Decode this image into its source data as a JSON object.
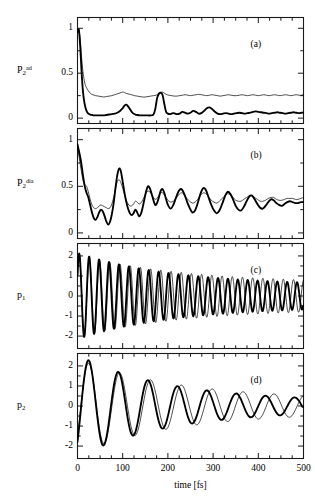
{
  "figure": {
    "xaxis": {
      "title": "time [fs]",
      "ticks": [
        "0",
        "100",
        "200",
        "300",
        "400",
        "500"
      ],
      "min": 0,
      "max": 500,
      "minor_tick_interval": 25
    },
    "panels": [
      {
        "tag": "(a)",
        "ylabel_base": "P",
        "ylabel_sub": "2",
        "ylabel_sup": "ad",
        "yticks": [
          "1",
          "0.5",
          "0"
        ],
        "ytick_values": [
          1,
          0.5,
          0
        ],
        "ymin": -0.06,
        "ymax": 1.12
      },
      {
        "tag": "(b)",
        "ylabel_base": "P",
        "ylabel_sub": "2",
        "ylabel_sup": "dia",
        "yticks": [
          "1",
          "0.5",
          "0"
        ],
        "ytick_values": [
          1,
          0.5,
          0
        ],
        "ymin": -0.06,
        "ymax": 1.12
      },
      {
        "tag": "(c)",
        "ylabel_base": "p",
        "ylabel_sub": "1",
        "ylabel_sup": "",
        "yticks": [
          "2",
          "1",
          "0",
          "-1",
          "-2"
        ],
        "ytick_values": [
          2,
          1,
          0,
          -1,
          -2
        ],
        "ymin": -2.62,
        "ymax": 2.62
      },
      {
        "tag": "(d)",
        "ylabel_base": "p",
        "ylabel_sub": "2",
        "ylabel_sup": "",
        "yticks": [
          "2",
          "1",
          "0",
          "-1",
          "-2"
        ],
        "ytick_values": [
          2,
          1,
          0,
          -1,
          -2
        ],
        "ymin": -2.62,
        "ymax": 2.62
      }
    ]
  },
  "chart_data": {
    "type": "line",
    "title": "",
    "xlabel": "time [fs]",
    "grid": false,
    "legend": "none",
    "series_styles": [
      {
        "name": "thick",
        "color": "#000000",
        "width": 1.8
      },
      {
        "name": "thin",
        "color": "#000000",
        "width": 0.7
      }
    ],
    "subplots": [
      {
        "tag": "(a)",
        "ylabel": "P_2^ad",
        "xlim": [
          0,
          500
        ],
        "ylim": [
          -0.06,
          1.12
        ],
        "yticks": [
          0,
          0.5,
          1
        ],
        "series": [
          {
            "name": "thick",
            "x": [
              0,
              3,
              6,
              9,
              12,
              15,
              18,
              21,
              24,
              28,
              32,
              36,
              40,
              46,
              52,
              58,
              64,
              70,
              76,
              82,
              88,
              94,
              100,
              104,
              108,
              112,
              116,
              120,
              124,
              128,
              132,
              138,
              144,
              150,
              156,
              162,
              168,
              172,
              176,
              180,
              184,
              188,
              192,
              196,
              200,
              204,
              208,
              212,
              216,
              220,
              226,
              232,
              238,
              244,
              250,
              256,
              262,
              268,
              274,
              280,
              286,
              292,
              298,
              304,
              310,
              316,
              322,
              328,
              334,
              340,
              346,
              352,
              358,
              364,
              370,
              376,
              382,
              388,
              394,
              400,
              406,
              412,
              418,
              424,
              430,
              436,
              442,
              448,
              454,
              460,
              466,
              472,
              478,
              484,
              490,
              496,
              500
            ],
            "y": [
              0.96,
              0.98,
              0.8,
              0.52,
              0.3,
              0.18,
              0.11,
              0.07,
              0.05,
              0.04,
              0.035,
              0.03,
              0.03,
              0.03,
              0.03,
              0.03,
              0.035,
              0.04,
              0.045,
              0.05,
              0.06,
              0.08,
              0.11,
              0.14,
              0.15,
              0.13,
              0.1,
              0.07,
              0.05,
              0.04,
              0.035,
              0.03,
              0.03,
              0.03,
              0.03,
              0.03,
              0.04,
              0.1,
              0.22,
              0.27,
              0.28,
              0.26,
              0.16,
              0.07,
              0.05,
              0.045,
              0.05,
              0.055,
              0.05,
              0.045,
              0.05,
              0.07,
              0.06,
              0.05,
              0.06,
              0.08,
              0.07,
              0.05,
              0.055,
              0.08,
              0.11,
              0.12,
              0.1,
              0.07,
              0.05,
              0.045,
              0.05,
              0.055,
              0.05,
              0.045,
              0.05,
              0.055,
              0.06,
              0.055,
              0.05,
              0.055,
              0.06,
              0.07,
              0.075,
              0.07,
              0.065,
              0.06,
              0.055,
              0.05,
              0.055,
              0.06,
              0.065,
              0.06,
              0.055,
              0.05,
              0.055,
              0.06,
              0.065,
              0.06,
              0.055,
              0.06,
              0.06
            ]
          },
          {
            "name": "thin",
            "x": [
              0,
              3,
              6,
              9,
              12,
              15,
              18,
              22,
              26,
              30,
              34,
              40,
              46,
              52,
              58,
              64,
              70,
              76,
              82,
              88,
              94,
              100,
              104,
              108,
              112,
              116,
              120,
              126,
              132,
              138,
              144,
              150,
              156,
              162,
              168,
              174,
              178,
              182,
              186,
              190,
              196,
              202,
              208,
              214,
              220,
              226,
              232,
              238,
              244,
              250,
              256,
              262,
              268,
              274,
              280,
              286,
              292,
              298,
              304,
              310,
              316,
              322,
              328,
              334,
              340,
              346,
              352,
              358,
              364,
              370,
              376,
              382,
              388,
              394,
              400,
              406,
              412,
              418,
              424,
              430,
              436,
              442,
              448,
              454,
              460,
              466,
              472,
              478,
              484,
              490,
              496,
              500
            ],
            "y": [
              0.97,
              0.99,
              0.88,
              0.68,
              0.52,
              0.42,
              0.36,
              0.32,
              0.29,
              0.27,
              0.26,
              0.25,
              0.245,
              0.24,
              0.235,
              0.24,
              0.245,
              0.25,
              0.26,
              0.27,
              0.28,
              0.29,
              0.285,
              0.275,
              0.27,
              0.265,
              0.26,
              0.25,
              0.245,
              0.24,
              0.235,
              0.235,
              0.24,
              0.245,
              0.25,
              0.255,
              0.27,
              0.285,
              0.29,
              0.285,
              0.265,
              0.255,
              0.25,
              0.245,
              0.245,
              0.25,
              0.255,
              0.26,
              0.255,
              0.25,
              0.255,
              0.26,
              0.265,
              0.26,
              0.255,
              0.25,
              0.255,
              0.26,
              0.255,
              0.25,
              0.245,
              0.25,
              0.255,
              0.26,
              0.255,
              0.25,
              0.25,
              0.255,
              0.26,
              0.255,
              0.25,
              0.255,
              0.26,
              0.255,
              0.25,
              0.255,
              0.26,
              0.255,
              0.25,
              0.255,
              0.26,
              0.255,
              0.25,
              0.255,
              0.26,
              0.255,
              0.25,
              0.255,
              0.26,
              0.255,
              0.255,
              0.26
            ]
          }
        ]
      },
      {
        "tag": "(b)",
        "ylabel": "P_2^dia",
        "xlim": [
          0,
          500
        ],
        "ylim": [
          -0.06,
          1.12
        ],
        "yticks": [
          0,
          0.5,
          1
        ],
        "series": [
          {
            "name": "thick",
            "x": [
              0,
              4,
              8,
              12,
              16,
              20,
              24,
              28,
              32,
              36,
              40,
              44,
              48,
              52,
              56,
              60,
              64,
              68,
              72,
              76,
              80,
              84,
              88,
              92,
              96,
              100,
              104,
              108,
              112,
              116,
              120,
              124,
              128,
              132,
              136,
              140,
              144,
              148,
              152,
              156,
              160,
              164,
              168,
              172,
              176,
              180,
              184,
              188,
              192,
              196,
              200,
              206,
              212,
              218,
              224,
              230,
              236,
              242,
              248,
              254,
              260,
              266,
              272,
              278,
              284,
              290,
              296,
              302,
              308,
              314,
              320,
              326,
              332,
              338,
              344,
              350,
              356,
              362,
              368,
              374,
              380,
              386,
              392,
              398,
              404,
              410,
              416,
              422,
              428,
              434,
              440,
              446,
              452,
              458,
              464,
              470,
              476,
              482,
              488,
              494,
              500
            ],
            "y": [
              0.95,
              0.86,
              0.76,
              0.62,
              0.5,
              0.43,
              0.38,
              0.3,
              0.22,
              0.16,
              0.14,
              0.17,
              0.22,
              0.25,
              0.23,
              0.18,
              0.12,
              0.09,
              0.12,
              0.2,
              0.32,
              0.48,
              0.62,
              0.69,
              0.66,
              0.55,
              0.43,
              0.33,
              0.26,
              0.21,
              0.19,
              0.21,
              0.25,
              0.22,
              0.18,
              0.2,
              0.27,
              0.36,
              0.45,
              0.5,
              0.48,
              0.42,
              0.35,
              0.3,
              0.32,
              0.38,
              0.45,
              0.47,
              0.43,
              0.36,
              0.3,
              0.26,
              0.3,
              0.38,
              0.45,
              0.47,
              0.42,
              0.34,
              0.27,
              0.22,
              0.24,
              0.32,
              0.42,
              0.48,
              0.46,
              0.38,
              0.3,
              0.24,
              0.21,
              0.24,
              0.31,
              0.39,
              0.44,
              0.42,
              0.36,
              0.29,
              0.25,
              0.24,
              0.28,
              0.34,
              0.39,
              0.4,
              0.36,
              0.31,
              0.27,
              0.26,
              0.29,
              0.33,
              0.36,
              0.35,
              0.32,
              0.3,
              0.29,
              0.31,
              0.33,
              0.34,
              0.33,
              0.32,
              0.32,
              0.33,
              0.33
            ]
          },
          {
            "name": "thin",
            "x": [
              0,
              4,
              8,
              12,
              16,
              20,
              24,
              28,
              32,
              36,
              40,
              44,
              48,
              52,
              56,
              60,
              64,
              68,
              72,
              76,
              80,
              84,
              88,
              92,
              96,
              100,
              104,
              108,
              112,
              116,
              120,
              124,
              128,
              132,
              136,
              140,
              144,
              148,
              152,
              156,
              160,
              164,
              168,
              172,
              176,
              180,
              184,
              188,
              192,
              196,
              200,
              206,
              212,
              218,
              224,
              230,
              236,
              242,
              248,
              254,
              260,
              266,
              272,
              278,
              284,
              290,
              296,
              302,
              308,
              314,
              320,
              326,
              332,
              338,
              344,
              350,
              356,
              362,
              368,
              374,
              380,
              386,
              392,
              398,
              404,
              410,
              416,
              422,
              428,
              434,
              440,
              446,
              452,
              458,
              464,
              470,
              476,
              482,
              488,
              494,
              500
            ],
            "y": [
              0.92,
              0.8,
              0.68,
              0.57,
              0.52,
              0.5,
              0.44,
              0.36,
              0.3,
              0.27,
              0.26,
              0.27,
              0.29,
              0.3,
              0.29,
              0.28,
              0.27,
              0.26,
              0.27,
              0.31,
              0.38,
              0.47,
              0.55,
              0.57,
              0.54,
              0.48,
              0.41,
              0.35,
              0.31,
              0.29,
              0.29,
              0.31,
              0.34,
              0.33,
              0.31,
              0.32,
              0.35,
              0.39,
              0.43,
              0.45,
              0.44,
              0.41,
              0.38,
              0.36,
              0.37,
              0.4,
              0.43,
              0.43,
              0.41,
              0.38,
              0.35,
              0.33,
              0.34,
              0.37,
              0.41,
              0.43,
              0.41,
              0.37,
              0.34,
              0.32,
              0.33,
              0.36,
              0.4,
              0.43,
              0.42,
              0.39,
              0.35,
              0.33,
              0.32,
              0.34,
              0.37,
              0.4,
              0.42,
              0.41,
              0.38,
              0.35,
              0.34,
              0.34,
              0.36,
              0.38,
              0.4,
              0.4,
              0.38,
              0.36,
              0.34,
              0.34,
              0.35,
              0.37,
              0.38,
              0.38,
              0.36,
              0.35,
              0.35,
              0.36,
              0.37,
              0.37,
              0.37,
              0.36,
              0.36,
              0.37,
              0.38
            ]
          }
        ]
      },
      {
        "tag": "(c)",
        "ylabel": "p_1",
        "xlim": [
          0,
          500
        ],
        "ylim": [
          -2.62,
          2.62
        ],
        "yticks": [
          -2,
          -1,
          0,
          1,
          2
        ],
        "oscillation_period_fs": 22,
        "envelope_start": 2.1,
        "envelope_end": 0.55,
        "series": [
          {
            "name": "thick",
            "description": "p1 thick curve: decaying oscillation, period ~22 fs, amplitude 2.1 decaying to ~0.55"
          },
          {
            "name": "thin",
            "description": "p1 thin curve: same period, slight phase lag growing with time, amplitude 2.0 decaying to ~0.6"
          }
        ]
      },
      {
        "tag": "(d)",
        "ylabel": "p_2",
        "xlim": [
          0,
          500
        ],
        "ylim": [
          -2.62,
          2.62
        ],
        "yticks": [
          -2,
          -1,
          0,
          1,
          2
        ],
        "oscillation_period_fs": 66,
        "envelope_start": 2.5,
        "envelope_end": 0.25,
        "series": [
          {
            "name": "thick",
            "description": "p2 thick curve: decaying oscillation, period ~66 fs, amplitude 2.5 decaying to ~0.25"
          },
          {
            "name": "thin",
            "description": "p2 thin curve: same period, phase lag growing with time, amplitude 2.3 decaying to ~0.3"
          }
        ]
      }
    ]
  }
}
